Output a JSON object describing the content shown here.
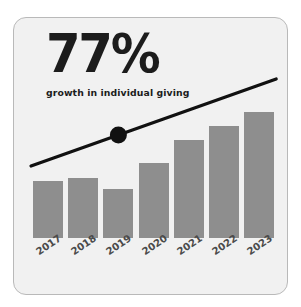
{
  "card": {
    "accent_color": "#8e8e8e",
    "background_color": "#f1f1f1",
    "border_color": "#b9b9b9",
    "line_color": "#111111"
  },
  "headline": {
    "stat": "77%",
    "subtitle": "growth in individual giving"
  },
  "chart_data": {
    "type": "bar",
    "title": "77%",
    "subtitle": "growth in individual giving",
    "xlabel": "",
    "ylabel": "",
    "grid": false,
    "legend": "none",
    "categories": [
      "2017",
      "2018",
      "2019",
      "2020",
      "2021",
      "2022",
      "2023"
    ],
    "values": [
      56,
      59,
      48,
      74,
      97,
      111,
      124
    ],
    "ylim": [
      0,
      148
    ],
    "bar_color": "#8e8e8e",
    "annotations": [
      {
        "type": "trendline",
        "color": "#111111",
        "marker_at_category": "2019",
        "marker_shape": "circle",
        "description": "rising trend line with dot marker at 2019"
      }
    ]
  }
}
